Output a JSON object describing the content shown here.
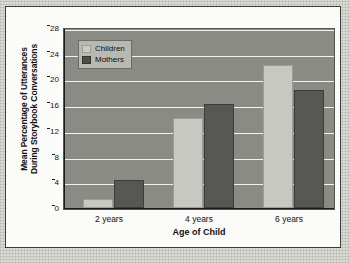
{
  "chart_data": {
    "type": "bar",
    "title": "",
    "xlabel": "Age of Child",
    "ylabel": "Mean Percentage of Utterances During Storybook Conversations",
    "ylabel_line1": "Mean Percentage of Utterances",
    "ylabel_line2": "During Storybook Conversations",
    "categories": [
      "2 years",
      "4 years",
      "6 years"
    ],
    "series": [
      {
        "name": "Children",
        "values": [
          1.4,
          14.0,
          22.3
        ],
        "color": "#c8c8c2"
      },
      {
        "name": "Mothers",
        "values": [
          4.3,
          16.2,
          18.3
        ],
        "color": "#575753"
      }
    ],
    "ylim": [
      0,
      28
    ],
    "yticks": [
      0,
      4,
      8,
      12,
      16,
      20,
      24,
      28
    ],
    "ytick_labels": [
      "0",
      "4",
      "8",
      "12",
      "16",
      "20",
      "24",
      "28"
    ],
    "grid": true,
    "legend_position": "top-left",
    "plot_background": "#8b8b86",
    "gridline_color": "#f2f2ee",
    "figure_background": "#fbfbf9"
  },
  "legend": {
    "items": [
      {
        "label": "Children"
      },
      {
        "label": "Mothers"
      }
    ]
  }
}
